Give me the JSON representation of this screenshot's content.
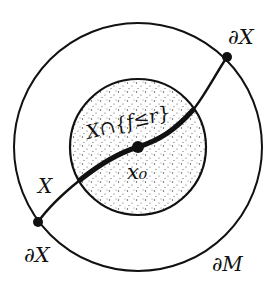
{
  "diagram": {
    "type": "manifold-with-boundary sketch",
    "colors": {
      "ink": "#111111",
      "background": "#ffffff",
      "stipple": "#444444"
    },
    "outer_circle": {
      "label": "∂M",
      "cx": 138,
      "cy": 147,
      "r": 124
    },
    "inner_disk": {
      "label": "X∩{f≤r}",
      "cx": 138,
      "cy": 147,
      "r": 68,
      "fill": "stippled"
    },
    "curve": {
      "label": "X"
    },
    "points": [
      {
        "id": "boundary_top_right",
        "label": "∂X",
        "x": 227,
        "y": 57
      },
      {
        "id": "center",
        "label": "x₀",
        "x": 138,
        "y": 147
      },
      {
        "id": "boundary_bottom_left",
        "label": "∂X",
        "x": 38,
        "y": 222
      }
    ],
    "labels": {
      "boundary_top_right": "∂X",
      "boundary_bottom_left": "∂X",
      "manifold_boundary": "∂M",
      "curve": "X",
      "sublevel_set": "X∩{f≤r}",
      "center_point": "x₀"
    }
  }
}
